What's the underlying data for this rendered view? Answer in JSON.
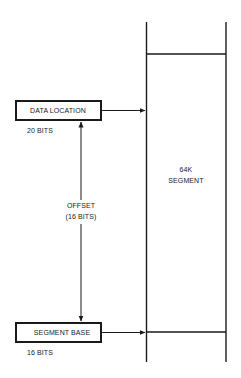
{
  "diagram": {
    "data_location": {
      "label": "DATA LOCATION",
      "bits": "20 BITS"
    },
    "segment_base": {
      "label": "SEGMENT BASE",
      "bits": "16 BITS"
    },
    "offset": {
      "label": "OFFSET",
      "bits": "(16 BITS)"
    },
    "segment": {
      "size": "64K",
      "label": "SEGMENT"
    },
    "colors": {
      "line": "#1a1a1a",
      "background": "#ffffff"
    }
  }
}
